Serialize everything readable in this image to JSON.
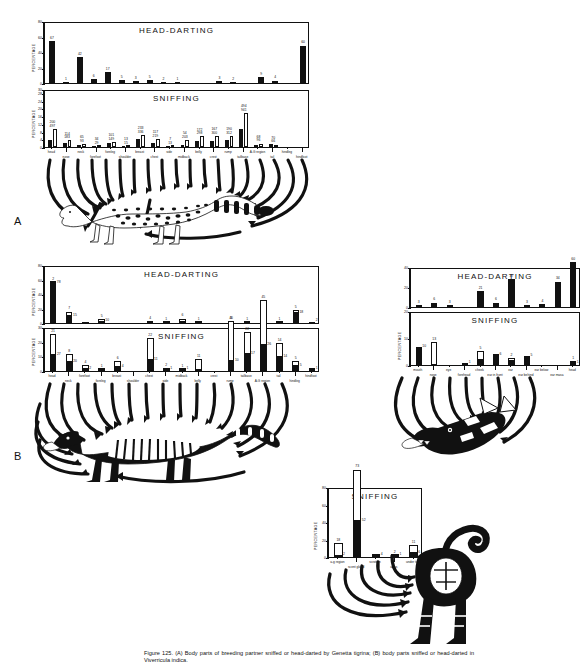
{
  "figure": {
    "caption": "Figure 125. (A) Body parts of breeding partner sniffed or head-darted by Genetta tigrina; (B) body parts sniffed or head-darted in Viverricula indica.",
    "panel_a_letter": "A",
    "panel_b_letter": "B",
    "axis_label": "PERCENTAGE"
  },
  "chart_data": [
    {
      "id": "a-head-darting",
      "type": "bar",
      "title": "HEAD-DARTING",
      "ylabel": "PERCENTAGE",
      "ylim": [
        0,
        80
      ],
      "yticks": [
        0,
        20,
        40,
        60,
        80
      ],
      "grid": false,
      "legend": "none",
      "categories": [
        "head",
        "nose",
        "neck",
        "forefoot",
        "foreleg",
        "shoulder",
        "breast",
        "chest",
        "side",
        "midback",
        "belly",
        "crest",
        "rump",
        "tailbase",
        "A-G region",
        "tail",
        "hindleg",
        "hindfoot",
        "all-over"
      ],
      "values": [
        67,
        1,
        42,
        6,
        17,
        5,
        3,
        5,
        2,
        1,
        0,
        0,
        3,
        2,
        0,
        9,
        4,
        0,
        60
      ],
      "labels": [
        "67",
        "1",
        "42",
        "6",
        "17",
        "5",
        "3",
        "5",
        "2",
        "1",
        "",
        "",
        "3",
        "2",
        "",
        "9",
        "4",
        "",
        "60"
      ]
    },
    {
      "id": "a-sniffing",
      "type": "bar",
      "title": "SNIFFING",
      "ylabel": "PERCENTAGE",
      "ylim": [
        0,
        30
      ],
      "yticks": [
        0,
        4,
        8,
        12,
        16,
        20,
        24,
        28,
        30
      ],
      "grid": false,
      "legend": "two-series (solid = male, open = female)",
      "categories": [
        "head",
        "nose",
        "neck",
        "forefoot",
        "foreleg",
        "shoulder",
        "breast",
        "chest",
        "side",
        "midback",
        "belly",
        "crest",
        "rump",
        "tailbase",
        "A-G region",
        "tail",
        "hindleg",
        "hindfoot"
      ],
      "series": [
        {
          "name": "solid",
          "values": [
            200,
            114,
            65,
            34,
            101,
            13,
            233,
            117,
            7,
            54,
            172,
            167,
            190,
            494,
            68,
            70,
            0,
            0
          ]
        },
        {
          "name": "open",
          "values": [
            497,
            183,
            93,
            29,
            149,
            15,
            336,
            219,
            13,
            203,
            298,
            300,
            312,
            941,
            96,
            66,
            0,
            0
          ]
        }
      ],
      "labels_top": [
        "200",
        "114",
        "65",
        "34",
        "101",
        "13",
        "233",
        "117",
        "7",
        "54",
        "172",
        "167",
        "190",
        "494",
        "68",
        "70"
      ],
      "labels_bottom": [
        "497",
        "183",
        "93",
        "29",
        "149",
        "15",
        "336",
        "219",
        "13",
        "203",
        "298",
        "300",
        "312",
        "941",
        "96",
        "66"
      ]
    },
    {
      "id": "b-head-darting",
      "type": "bar-stacked",
      "title": "HEAD-DARTING",
      "ylabel": "PERCENTAGE",
      "ylim": [
        0,
        80
      ],
      "yticks": [
        0,
        20,
        40,
        60,
        80
      ],
      "grid": false,
      "categories": [
        "head",
        "neck",
        "forefoot",
        "foreleg",
        "breast",
        "shoulder",
        "chest",
        "side",
        "midback",
        "belly",
        "crest",
        "rump",
        "tailbase",
        "A-G region",
        "tail",
        "hindleg",
        "hindfoot"
      ],
      "series": [
        {
          "name": "solid-lower",
          "values": [
            70,
            13,
            2,
            2,
            0,
            0,
            0,
            0,
            1,
            0,
            0,
            0,
            0,
            0,
            0,
            18,
            2
          ]
        },
        {
          "name": "open-upper",
          "values": [
            2,
            7,
            0,
            5,
            0,
            0,
            4,
            1,
            6,
            1,
            0,
            3,
            1,
            0,
            1,
            5,
            0
          ]
        }
      ],
      "labels_open": [
        "2",
        "7",
        "",
        "5",
        "",
        "",
        "4",
        "1",
        "6",
        "1",
        "",
        "3",
        "1",
        "",
        "1",
        "5",
        ""
      ],
      "labels_solid": [
        "78",
        "15",
        "",
        "10",
        "",
        "",
        "",
        "",
        "",
        "",
        "",
        "",
        "",
        "",
        "",
        "18",
        "2"
      ]
    },
    {
      "id": "b-sniffing",
      "type": "bar-stacked",
      "title": "SNIFFING",
      "ylabel": "PERCENTAGE",
      "ylim": [
        0,
        30
      ],
      "yticks": [
        0,
        10,
        20,
        30
      ],
      "grid": false,
      "categories": [
        "head",
        "neck",
        "forefoot",
        "foreleg",
        "breast",
        "shoulder",
        "chest",
        "side",
        "midback",
        "belly",
        "crest",
        "rump",
        "tailbase",
        "A-G region",
        "tail",
        "hindleg",
        "hindfoot"
      ],
      "series": [
        {
          "name": "solid-lower",
          "values": [
            16,
            9,
            2,
            1,
            4,
            0,
            11,
            1,
            1,
            1,
            0,
            10,
            17,
            26,
            14,
            5,
            1
          ]
        },
        {
          "name": "open-upper",
          "values": [
            21,
            8,
            4,
            1,
            6,
            0,
            22,
            2,
            1,
            11,
            0,
            40,
            22,
            45,
            14,
            5,
            1
          ]
        }
      ],
      "labels_open": [
        "21",
        "8",
        "4",
        "1",
        "6",
        "",
        "22",
        "2",
        "1",
        "11",
        "",
        "40",
        "22",
        "45",
        "14",
        "5",
        ""
      ],
      "labels_solid": [
        "27",
        "20",
        "2",
        "",
        "4",
        "",
        "11",
        "1",
        "1",
        "",
        "",
        "10",
        "17",
        "26",
        "14",
        "5",
        "1"
      ]
    },
    {
      "id": "b-head-head-darting",
      "type": "bar",
      "title": "HEAD-DARTING",
      "ylabel": "PERCENTAGE",
      "ylim": [
        0,
        40
      ],
      "yticks": [
        0,
        20,
        40
      ],
      "grid": false,
      "categories": [
        "mouth",
        "nose",
        "eye",
        "forehead",
        "cheek",
        "ear in front",
        "ear",
        "ear behind",
        "ear below",
        "ear masa",
        "head"
      ],
      "values": [
        3,
        6,
        3,
        0,
        21,
        6,
        37,
        3,
        4,
        34,
        60
      ],
      "labels": [
        "3",
        "6",
        "3",
        "",
        "21",
        "6",
        "37",
        "3",
        "4",
        "34",
        "60"
      ]
    },
    {
      "id": "b-head-sniffing",
      "type": "bar-stacked",
      "title": "SNIFFING",
      "ylabel": "PERCENTAGE",
      "ylim": [
        0,
        20
      ],
      "yticks": [
        0,
        10,
        20
      ],
      "grid": false,
      "categories": [
        "mouth",
        "nose",
        "eye",
        "forehead",
        "cheek",
        "ear in front",
        "ear",
        "ear behind",
        "ear below",
        "ear masa",
        "head"
      ],
      "series": [
        {
          "name": "solid-lower",
          "values": [
            10,
            0,
            0,
            1,
            3,
            6,
            2,
            5,
            0,
            0,
            1
          ]
        },
        {
          "name": "open-upper",
          "values": [
            0,
            13,
            0,
            0,
            5,
            0,
            2,
            0,
            0,
            0,
            1
          ]
        }
      ],
      "labels_solid": [
        "10",
        "",
        "",
        "1",
        "",
        "6",
        "",
        "5",
        "",
        "",
        "1"
      ],
      "labels_open": [
        "",
        "13",
        "",
        "",
        "5",
        "",
        "2",
        "",
        "",
        "",
        "1"
      ]
    },
    {
      "id": "c-sniffing",
      "type": "bar-stacked",
      "title": "SNIFFING",
      "ylabel": "PERCENTAGE",
      "ylim": [
        0,
        80
      ],
      "yticks": [
        0,
        20,
        40,
        60,
        80
      ],
      "grid": false,
      "categories": [
        "a-g region",
        "scent gland",
        "scrotum",
        "anus",
        "under tail"
      ],
      "series": [
        {
          "name": "solid-lower",
          "values": [
            2,
            52,
            4,
            1,
            6
          ]
        },
        {
          "name": "open-upper",
          "values": [
            18,
            73,
            0,
            2,
            11
          ]
        }
      ],
      "labels_solid": [
        "2",
        "52",
        "4",
        "1",
        "6"
      ],
      "labels_open": [
        "18",
        "73",
        "",
        "2",
        "11"
      ]
    }
  ],
  "chart_titles": {
    "head_darting": "HEAD-DARTING",
    "sniffing": "SNIFFING"
  }
}
